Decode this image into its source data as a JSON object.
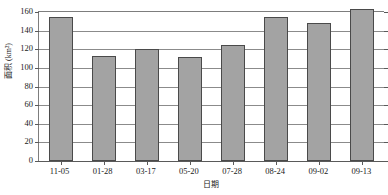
{
  "chart_data": {
    "type": "bar",
    "title": "",
    "xlabel": "日期",
    "ylabel": "面积 (km²)",
    "categories": [
      "11-05",
      "01-28",
      "03-17",
      "05-20",
      "07-28",
      "08-24",
      "09-02",
      "09-13"
    ],
    "values": [
      155,
      113,
      120,
      112,
      125,
      155,
      148,
      163
    ],
    "ylim": [
      0,
      160
    ],
    "yticks": [
      0,
      20,
      40,
      60,
      80,
      100,
      120,
      140,
      160
    ],
    "ytick_labels": [
      "0",
      "20",
      "40",
      "60",
      "80",
      "100",
      "120",
      "140",
      "160"
    ],
    "grid": true,
    "legend": false,
    "series_color": "#a3a3a3",
    "bar_edge_color": "#4a4a4a",
    "axis_color": "#5a5a5a",
    "gridline_color": "#8b8b8b"
  }
}
